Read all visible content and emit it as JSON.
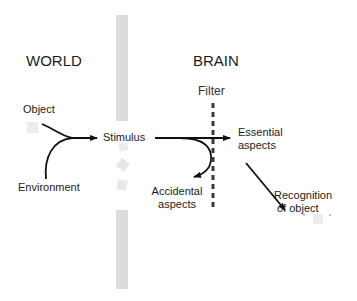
{
  "headings": {
    "world": "WORLD",
    "brain": "BRAIN"
  },
  "labels": {
    "object": "Object",
    "environment": "Environment",
    "stimulus": "Stimulus",
    "filter": "Filter",
    "essential_line1": "Essential",
    "essential_line2": "aspects",
    "accidental_line1": "Accidental",
    "accidental_line2": "aspects",
    "recognition_line1": "Recognition",
    "recognition_line2": "of object"
  },
  "colors": {
    "barrier": "#dcdcdc",
    "arrow": "#111111",
    "filter_line": "#3a3a3a",
    "text": "#1c1c1c"
  }
}
